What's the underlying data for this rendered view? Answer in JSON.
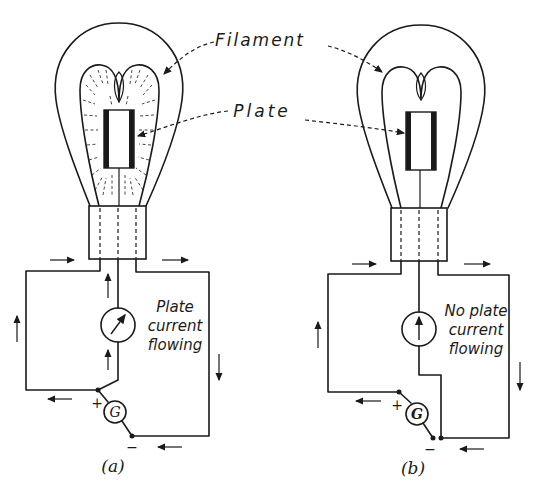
{
  "figure": {
    "labels": {
      "filament": "Filament",
      "plate": "Plate"
    },
    "panels": [
      {
        "id": "a",
        "caption": "(a)",
        "status_line1": "Plate",
        "status_line2": "current",
        "status_line3": "flowing",
        "meter_state": "deflected",
        "generator_label": "G",
        "plus": "+",
        "minus": "−",
        "electron_emission": true
      },
      {
        "id": "b",
        "caption": "(b)",
        "status_line1": "No plate",
        "status_line2": "current",
        "status_line3": "flowing",
        "meter_state": "zero",
        "generator_label": "G",
        "plus": "+",
        "minus": "−",
        "electron_emission": false
      }
    ]
  }
}
